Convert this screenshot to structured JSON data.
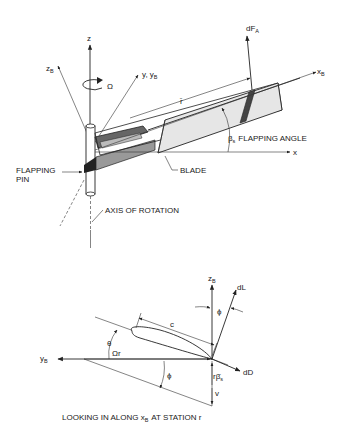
{
  "top_figure": {
    "axis_z": "z",
    "axis_zB": "z",
    "axis_zB_sub": "B",
    "axis_y": "y, y",
    "axis_y_sub": "B",
    "rotation_symbol": "Ω",
    "force_label": "dF",
    "force_sub": "A",
    "axis_xB": "x",
    "axis_xB_sub": "B",
    "axis_x": "x",
    "radius_label": "r̄",
    "flapping_symbol": "β",
    "flapping_sub": "s",
    "flapping_text": "FLAPPING ANGLE",
    "blade_label": "BLADE",
    "pin_label_1": "FLAPPING",
    "pin_label_2": "PIN",
    "axis_rotation_label": "AXIS OF ROTATION"
  },
  "bottom_figure": {
    "zB": "z",
    "zB_sub": "B",
    "dL": "dL",
    "phi_top": "ϕ",
    "chord": "c",
    "theta": "θ",
    "yB": "y",
    "yB_sub": "B",
    "omega_r": "Ωr",
    "phi_bottom": "ϕ",
    "r_beta": "rβ̇",
    "r_beta_sub": "s",
    "dD": "dD",
    "v": "v",
    "caption_1": "LOOKING IN ALONG x",
    "caption_sub": "B",
    "caption_2": "AT STATION r"
  }
}
